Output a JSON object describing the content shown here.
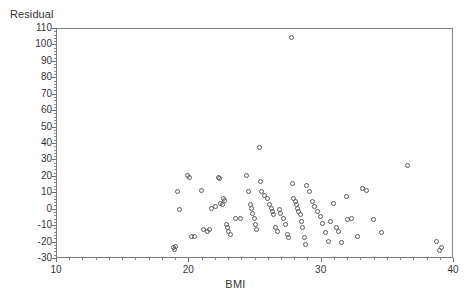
{
  "chart_data": {
    "type": "scatter",
    "title": "",
    "xlabel": "BMI",
    "ylabel": "Residual",
    "xlim": [
      10,
      40
    ],
    "ylim": [
      -30,
      110
    ],
    "xticks": [
      10,
      20,
      30,
      40
    ],
    "xtick_labels": [
      "10",
      "20",
      "30",
      "40"
    ],
    "x_minor_step": 1,
    "yticks": [
      -30,
      -20,
      -10,
      0,
      10,
      20,
      30,
      40,
      50,
      60,
      70,
      80,
      90,
      100,
      110
    ],
    "ytick_labels": [
      "-30",
      "-20",
      "-10",
      "0",
      "10",
      "20",
      "30",
      "40",
      "50",
      "60",
      "70",
      "80",
      "90",
      "100",
      "110"
    ],
    "y_minor_step": 2,
    "grid": false,
    "legend": null,
    "marker": "open-circle",
    "marker_color": "#5a5a5a",
    "frame_color": "#7d7d7d",
    "background": "#ffffff",
    "points": [
      {
        "x": 18.9,
        "y": -24
      },
      {
        "x": 19.0,
        "y": -25
      },
      {
        "x": 19.1,
        "y": -23
      },
      {
        "x": 19.2,
        "y": 10
      },
      {
        "x": 19.4,
        "y": -1
      },
      {
        "x": 20.0,
        "y": 20
      },
      {
        "x": 20.1,
        "y": 19
      },
      {
        "x": 20.3,
        "y": -17
      },
      {
        "x": 20.5,
        "y": -17
      },
      {
        "x": 21.0,
        "y": 11
      },
      {
        "x": 21.2,
        "y": -13
      },
      {
        "x": 21.5,
        "y": -14
      },
      {
        "x": 21.6,
        "y": -13
      },
      {
        "x": 21.8,
        "y": 0
      },
      {
        "x": 22.1,
        "y": 1
      },
      {
        "x": 22.3,
        "y": 19
      },
      {
        "x": 22.4,
        "y": 18
      },
      {
        "x": 22.5,
        "y": 3
      },
      {
        "x": 22.6,
        "y": 2
      },
      {
        "x": 22.7,
        "y": 6
      },
      {
        "x": 22.8,
        "y": 5
      },
      {
        "x": 22.9,
        "y": -10
      },
      {
        "x": 23.0,
        "y": -12
      },
      {
        "x": 23.1,
        "y": -14
      },
      {
        "x": 23.2,
        "y": -16
      },
      {
        "x": 23.6,
        "y": -6
      },
      {
        "x": 24.0,
        "y": -6
      },
      {
        "x": 24.4,
        "y": 20
      },
      {
        "x": 24.6,
        "y": 10
      },
      {
        "x": 24.7,
        "y": 2
      },
      {
        "x": 24.8,
        "y": 0
      },
      {
        "x": 24.9,
        "y": -3
      },
      {
        "x": 25.0,
        "y": -6
      },
      {
        "x": 25.1,
        "y": -10
      },
      {
        "x": 25.2,
        "y": -13
      },
      {
        "x": 25.4,
        "y": 37
      },
      {
        "x": 25.5,
        "y": 16
      },
      {
        "x": 25.6,
        "y": 10
      },
      {
        "x": 25.8,
        "y": 8
      },
      {
        "x": 26.0,
        "y": 6
      },
      {
        "x": 26.2,
        "y": 2
      },
      {
        "x": 26.3,
        "y": 0
      },
      {
        "x": 26.4,
        "y": -2
      },
      {
        "x": 26.5,
        "y": -4
      },
      {
        "x": 26.6,
        "y": -12
      },
      {
        "x": 26.8,
        "y": -14
      },
      {
        "x": 26.9,
        "y": -1
      },
      {
        "x": 27.0,
        "y": -3
      },
      {
        "x": 27.2,
        "y": -6
      },
      {
        "x": 27.4,
        "y": -10
      },
      {
        "x": 27.5,
        "y": -16
      },
      {
        "x": 27.6,
        "y": -18
      },
      {
        "x": 27.8,
        "y": 104
      },
      {
        "x": 27.9,
        "y": 15
      },
      {
        "x": 28.0,
        "y": 6
      },
      {
        "x": 28.1,
        "y": 4
      },
      {
        "x": 28.2,
        "y": 2
      },
      {
        "x": 28.3,
        "y": 0
      },
      {
        "x": 28.4,
        "y": -2
      },
      {
        "x": 28.5,
        "y": -4
      },
      {
        "x": 28.6,
        "y": -8
      },
      {
        "x": 28.7,
        "y": -12
      },
      {
        "x": 28.8,
        "y": -18
      },
      {
        "x": 28.9,
        "y": -22
      },
      {
        "x": 29.0,
        "y": 14
      },
      {
        "x": 29.2,
        "y": 10
      },
      {
        "x": 29.4,
        "y": 4
      },
      {
        "x": 29.6,
        "y": 1
      },
      {
        "x": 29.8,
        "y": -2
      },
      {
        "x": 30.0,
        "y": -5
      },
      {
        "x": 30.2,
        "y": -9
      },
      {
        "x": 30.4,
        "y": -15
      },
      {
        "x": 30.6,
        "y": -20
      },
      {
        "x": 30.8,
        "y": -8
      },
      {
        "x": 31.0,
        "y": 3
      },
      {
        "x": 31.2,
        "y": -12
      },
      {
        "x": 31.4,
        "y": -14
      },
      {
        "x": 31.6,
        "y": -21
      },
      {
        "x": 32.0,
        "y": 7
      },
      {
        "x": 32.1,
        "y": -7
      },
      {
        "x": 32.4,
        "y": -6
      },
      {
        "x": 32.8,
        "y": -17
      },
      {
        "x": 33.2,
        "y": 12
      },
      {
        "x": 33.5,
        "y": 11
      },
      {
        "x": 34.0,
        "y": -7
      },
      {
        "x": 34.6,
        "y": -15
      },
      {
        "x": 36.6,
        "y": 26
      },
      {
        "x": 38.8,
        "y": -20
      },
      {
        "x": 39.0,
        "y": -26
      },
      {
        "x": 39.2,
        "y": -24
      }
    ]
  }
}
